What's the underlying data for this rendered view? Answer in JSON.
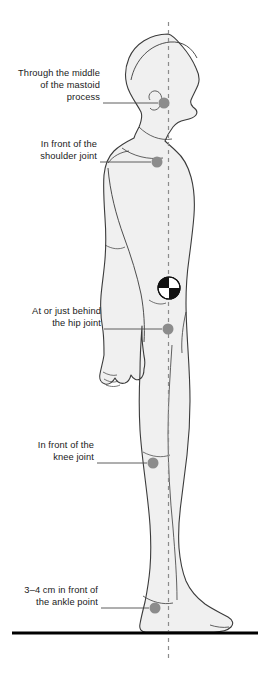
{
  "diagram": {
    "colors": {
      "body_fill": "#f0f0f0",
      "body_outline": "#3b3b3b",
      "marker": "#8c8c8c",
      "plumb_line": "#8c8c8c",
      "leader_line": "#4d4d4d",
      "floor_line": "#000000",
      "text": "#1a1a1a",
      "cog_dark": "#111111",
      "cog_light": "#ffffff"
    },
    "plumb_line": {
      "name": "line-of-gravity",
      "x": 168.5,
      "y_top": 22,
      "y_bottom": 660,
      "style": "dashed"
    },
    "floor": {
      "name": "ground-line",
      "x_start": 12,
      "x_end": 258,
      "y": 633
    },
    "center_of_gravity": {
      "label": "center-of-gravity-symbol",
      "cx": 169,
      "cy": 288,
      "r": 11
    },
    "landmarks": [
      {
        "id": "mastoid",
        "label": "Through the middle\nof the mastoid\nprocess",
        "dot": {
          "cx": 164,
          "cy": 103,
          "r": 5.5
        },
        "leader": {
          "x1": 103,
          "y1": 103,
          "x2": 158,
          "y2": 103
        },
        "text_box": {
          "left": 8,
          "top": 67,
          "width": 92
        }
      },
      {
        "id": "shoulder",
        "label": "In front of the\nshoulder joint",
        "dot": {
          "cx": 157,
          "cy": 162,
          "r": 5.5
        },
        "leader": {
          "x1": 100,
          "y1": 162,
          "x2": 151,
          "y2": 162
        },
        "text_box": {
          "left": 8,
          "top": 138,
          "width": 89
        }
      },
      {
        "id": "hip",
        "label": "At or just behind\nthe hip joint",
        "dot": {
          "cx": 168,
          "cy": 329,
          "r": 5.5
        },
        "leader": {
          "x1": 104,
          "y1": 329,
          "x2": 162,
          "y2": 329
        },
        "text_box": {
          "left": 8,
          "top": 305,
          "width": 93
        }
      },
      {
        "id": "knee",
        "label": "In front of the\nknee joint",
        "dot": {
          "cx": 153,
          "cy": 463,
          "r": 5.5
        },
        "leader": {
          "x1": 97,
          "y1": 463,
          "x2": 147,
          "y2": 463
        },
        "text_box": {
          "left": 8,
          "top": 439,
          "width": 86
        }
      },
      {
        "id": "ankle",
        "label": "3–4 cm in front of\nthe ankle point",
        "dot": {
          "cx": 155,
          "cy": 608,
          "r": 5.5
        },
        "leader": {
          "x1": 101,
          "y1": 608,
          "x2": 149,
          "y2": 608
        },
        "text_box": {
          "left": 8,
          "top": 584,
          "width": 90
        }
      }
    ],
    "caption": {
      "text": "",
      "top": 664,
      "visible": false
    }
  }
}
